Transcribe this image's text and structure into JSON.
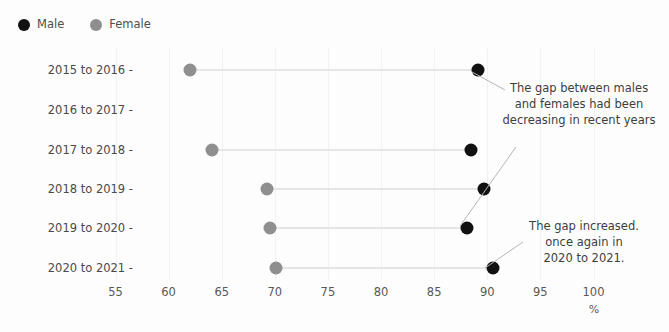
{
  "chart_data": {
    "type": "bar",
    "subtype": "dumbbell",
    "title": "",
    "xlabel": "%",
    "ylabel": "",
    "xlim": [
      55,
      100
    ],
    "xticks": [
      55,
      60,
      65,
      70,
      75,
      80,
      85,
      90,
      95,
      100
    ],
    "grid": true,
    "legend_position": "top-left",
    "categories": [
      "2015 to 2016",
      "2016 to 2017",
      "2017 to 2018",
      "2018 to 2019",
      "2019 to 2020",
      "2020 to 2021"
    ],
    "series": [
      {
        "name": "Male",
        "color": "#111111",
        "values": [
          89.1,
          null,
          88.5,
          89.7,
          88.1,
          90.5
        ]
      },
      {
        "name": "Female",
        "color": "#8f8f8f",
        "values": [
          62.0,
          null,
          64.1,
          69.3,
          69.5,
          70.1
        ]
      }
    ],
    "annotations": [
      {
        "text": "The gap between males\nand females had been\ndecreasing in recent years"
      },
      {
        "text": "The gap increased.\nonce again in\n2020 to 2021."
      }
    ]
  },
  "legend": {
    "items": [
      {
        "label": "Male",
        "color": "#111111"
      },
      {
        "label": "Female",
        "color": "#8f8f8f"
      }
    ]
  },
  "axis": {
    "unit": "%",
    "xticks": [
      "55",
      "60",
      "65",
      "70",
      "75",
      "80",
      "85",
      "90",
      "95",
      "100"
    ],
    "ycategories": [
      "2015 to 2016 -",
      "2016 to 2017 -",
      "2017 to 2018 -",
      "2018 to 2019 -",
      "2019 to 2020 -",
      "2020 to 2021 -"
    ]
  },
  "annotations": {
    "first": "The gap between males\nand females had been\ndecreasing in recent years",
    "second": "The gap increased.\nonce again in\n2020 to 2021."
  },
  "colors": {
    "male": "#111111",
    "female": "#8f8f8f",
    "connector": "#e6e6e6",
    "grid": "#f2f2f2",
    "background": "#fdfdfd",
    "text": "#4a4a4a"
  }
}
